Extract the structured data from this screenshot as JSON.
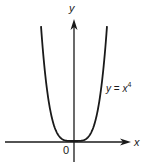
{
  "chart_data": {
    "type": "line",
    "title": "",
    "xlabel": "x",
    "ylabel": "y",
    "origin_label": "0",
    "series": [
      {
        "name": "y = x^4",
        "label": "y = x⁴",
        "x": [
          -1.3,
          -1.2,
          -1.1,
          -1.0,
          -0.8,
          -0.6,
          -0.4,
          -0.2,
          0,
          0.2,
          0.4,
          0.6,
          0.8,
          1.0,
          1.1,
          1.2,
          1.3
        ],
        "y": [
          2.86,
          2.07,
          1.46,
          1.0,
          0.41,
          0.13,
          0.03,
          0.0,
          0,
          0.0,
          0.03,
          0.13,
          0.41,
          1.0,
          1.46,
          2.07,
          2.86
        ]
      }
    ],
    "grid": false,
    "legend": "inline annotation right of curve",
    "color": "#1a1a1a"
  },
  "labels": {
    "x_axis": "x",
    "y_axis": "y",
    "origin": "0",
    "eq_y": "y",
    "eq_eq": " = ",
    "eq_x": "x",
    "eq_exp": "4"
  }
}
